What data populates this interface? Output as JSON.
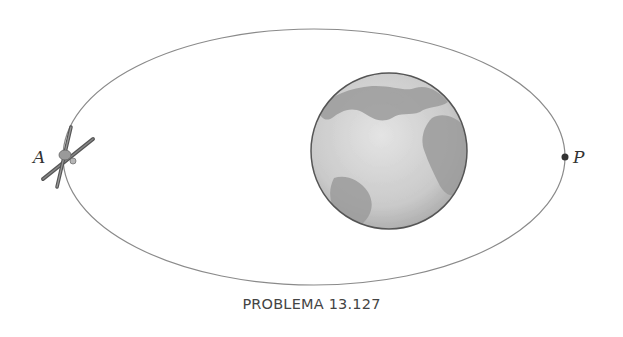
{
  "figure": {
    "caption": "PROBLEMA 13.127",
    "orbit": {
      "cx": 314,
      "cy": 157,
      "rx": 251,
      "ry": 128,
      "stroke": "#8a8a8a"
    },
    "earth": {
      "cx": 389,
      "cy": 151,
      "r": 78,
      "ocean": "#cfcfcf",
      "land": "#9a9a9a",
      "outline": "#555555"
    },
    "points": [
      {
        "id": "A",
        "label": "A",
        "description": "satellite at apogee",
        "x": 63,
        "y": 157
      },
      {
        "id": "P",
        "label": "P",
        "description": "perigee",
        "x": 565,
        "y": 157
      }
    ]
  }
}
